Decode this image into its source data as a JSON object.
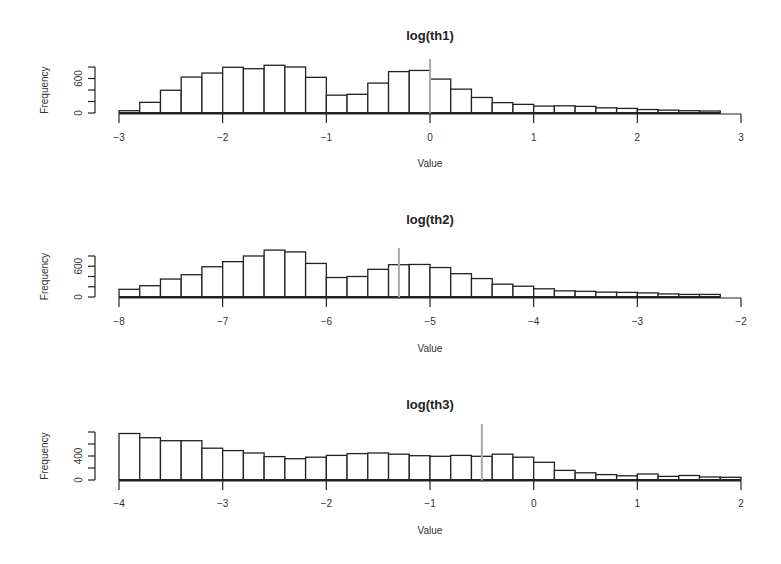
{
  "chart_data": [
    {
      "type": "bar",
      "subtype": "histogram",
      "title": "log(th1)",
      "xlabel": "Value",
      "ylabel": "Frequency",
      "xlim": [
        -3,
        3
      ],
      "ylim": [
        0,
        800
      ],
      "x_ticks": [
        -3,
        -2,
        -1,
        0,
        1,
        2,
        3
      ],
      "y_ticks": [
        0,
        200,
        400,
        600,
        800
      ],
      "y_tick_labels": {
        "0": "0",
        "600": "600"
      },
      "bin_start": -3,
      "bin_width": 0.2,
      "values": [
        40,
        185,
        395,
        625,
        695,
        795,
        770,
        830,
        800,
        620,
        310,
        325,
        520,
        720,
        740,
        590,
        415,
        270,
        180,
        150,
        120,
        125,
        115,
        90,
        80,
        60,
        50,
        40,
        35
      ],
      "vline": 0,
      "grid": false
    },
    {
      "type": "bar",
      "subtype": "histogram",
      "title": "log(th2)",
      "xlabel": "Value",
      "ylabel": "Frequency",
      "xlim": [
        -8,
        -2
      ],
      "ylim": [
        0,
        800
      ],
      "x_ticks": [
        -8,
        -7,
        -6,
        -5,
        -4,
        -3,
        -2
      ],
      "y_ticks": [
        0,
        200,
        400,
        600,
        800
      ],
      "y_tick_labels": {
        "0": "0",
        "600": "600"
      },
      "bin_start": -8,
      "bin_width": 0.2,
      "values": [
        150,
        220,
        350,
        435,
        590,
        690,
        800,
        915,
        880,
        655,
        380,
        400,
        540,
        630,
        635,
        575,
        455,
        360,
        250,
        210,
        160,
        120,
        110,
        95,
        90,
        80,
        60,
        50,
        50
      ],
      "vline": -5.3,
      "grid": false
    },
    {
      "type": "bar",
      "subtype": "histogram",
      "title": "log(th3)",
      "xlabel": "Value",
      "ylabel": "Frequency",
      "xlim": [
        -4,
        2
      ],
      "ylim": [
        0,
        800
      ],
      "x_ticks": [
        -4,
        -3,
        -2,
        -1,
        0,
        1,
        2
      ],
      "y_ticks": [
        0,
        200,
        400,
        600,
        800
      ],
      "y_tick_labels": {
        "0": "0",
        "400": "400"
      },
      "bin_start": -4,
      "bin_width": 0.2,
      "values": [
        775,
        705,
        655,
        655,
        530,
        490,
        450,
        390,
        355,
        380,
        410,
        440,
        450,
        430,
        405,
        395,
        410,
        395,
        430,
        380,
        295,
        160,
        120,
        90,
        70,
        100,
        60,
        75,
        50,
        45
      ],
      "vline": -0.5,
      "grid": false
    }
  ],
  "layout": {
    "panels": [
      {
        "title_y": 40,
        "baseline_y": 113,
        "ytop_y": 67,
        "ticklabel_y": 141,
        "xlabel_y": 167
      },
      {
        "title_y": 224,
        "baseline_y": 297,
        "ytop_y": 256,
        "ticklabel_y": 325,
        "xlabel_y": 352
      },
      {
        "title_y": 409,
        "baseline_y": 480,
        "ytop_y": 432,
        "ticklabel_y": 507,
        "xlabel_y": 534
      }
    ],
    "x_left_px": 119,
    "x_right_px": 741,
    "yaxis_x_px": 95,
    "ylabel_x_px": 48
  }
}
